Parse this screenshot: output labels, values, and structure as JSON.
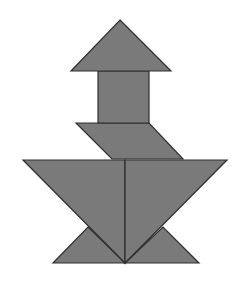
{
  "figure": {
    "piece_color": "#7a7a7a",
    "outline_color": "#2e2e2e",
    "background_color": "#ffffff",
    "pieces": [
      {
        "id": "medium-triangle",
        "shape": "triangle"
      },
      {
        "id": "square",
        "shape": "square"
      },
      {
        "id": "parallelogram",
        "shape": "parallelogram"
      },
      {
        "id": "large-triangle-left",
        "shape": "triangle"
      },
      {
        "id": "large-triangle-right",
        "shape": "triangle"
      },
      {
        "id": "small-triangle-left",
        "shape": "triangle"
      },
      {
        "id": "small-triangle-right",
        "shape": "triangle"
      }
    ]
  }
}
